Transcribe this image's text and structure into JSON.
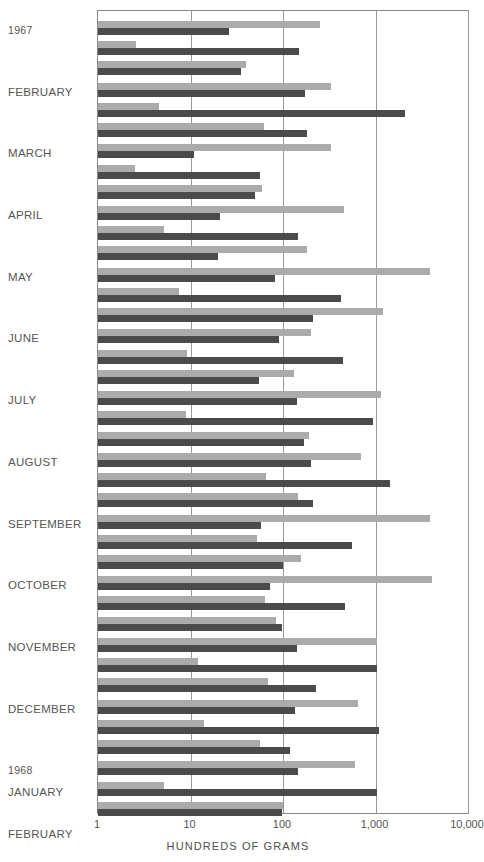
{
  "chart_data": {
    "type": "bar",
    "orientation": "horizontal",
    "title": "",
    "subtitle": "",
    "xlabel": "HUNDREDS OF GRAMS",
    "ylabel": "",
    "xscale": "log",
    "xlim": [
      1,
      10000
    ],
    "xticks": [
      1,
      10,
      100,
      1000,
      10000
    ],
    "xticklabels": [
      "1",
      "10",
      "100",
      "1,000",
      "10,000"
    ],
    "grid": true,
    "legend": "none",
    "colors": {
      "light_series": "#ababab",
      "dark_series": "#4b4b4b",
      "frame": "#8a8a8a",
      "gridline": "#9a9a9a",
      "text": "#565656"
    },
    "series": [
      {
        "name": "light",
        "color": "#ababab"
      },
      {
        "name": "dark",
        "color": "#4b4b4b"
      }
    ],
    "categories": [
      "1967",
      "FEBRUARY",
      "MARCH",
      "APRIL",
      "MAY",
      "JUNE",
      "JULY",
      "AUGUST",
      "SEPTEMBER",
      "OCTOBER",
      "NOVEMBER",
      "DECEMBER",
      "1968",
      "JANUARY",
      "FEBRUARY"
    ],
    "groups": [
      {
        "label": "1967",
        "label_kind": "year",
        "pairs": [
          {
            "light": 250,
            "dark": 26
          },
          {
            "light": 2.6,
            "dark": 150
          },
          {
            "light": 40,
            "dark": 35
          }
        ]
      },
      {
        "label": "FEBRUARY",
        "label_kind": "month",
        "pairs": [
          {
            "light": 330,
            "dark": 175
          },
          {
            "light": 4.6,
            "dark": 2100
          },
          {
            "light": 62,
            "dark": 180
          }
        ]
      },
      {
        "label": "MARCH",
        "label_kind": "month",
        "pairs": [
          {
            "light": 330,
            "dark": 11
          },
          {
            "light": 2.5,
            "dark": 56
          },
          {
            "light": 60,
            "dark": 50
          }
        ]
      },
      {
        "label": "APRIL",
        "label_kind": "month",
        "pairs": [
          {
            "light": 460,
            "dark": 21
          },
          {
            "light": 5.2,
            "dark": 145
          },
          {
            "light": 180,
            "dark": 20
          }
        ]
      },
      {
        "label": "MAY",
        "label_kind": "month",
        "pairs": [
          {
            "light": 3900,
            "dark": 82
          },
          {
            "light": 7.5,
            "dark": 420
          },
          {
            "light": 1200,
            "dark": 210
          }
        ]
      },
      {
        "label": "JUNE",
        "label_kind": "month",
        "pairs": [
          {
            "light": 200,
            "dark": 90
          },
          {
            "light": 9.2,
            "dark": 440
          },
          {
            "light": 130,
            "dark": 55
          }
        ]
      },
      {
        "label": "JULY",
        "label_kind": "month",
        "pairs": [
          {
            "light": 1150,
            "dark": 140
          },
          {
            "light": 9.0,
            "dark": 950
          },
          {
            "light": 190,
            "dark": 170
          }
        ]
      },
      {
        "label": "AUGUST",
        "label_kind": "month",
        "pairs": [
          {
            "light": 700,
            "dark": 200
          },
          {
            "light": 66,
            "dark": 1450
          },
          {
            "light": 145,
            "dark": 210
          }
        ]
      },
      {
        "label": "SEPTEMBER",
        "label_kind": "month",
        "pairs": [
          {
            "light": 3900,
            "dark": 58
          },
          {
            "light": 52,
            "dark": 560
          },
          {
            "light": 155,
            "dark": 100
          }
        ]
      },
      {
        "label": "OCTOBER",
        "label_kind": "month",
        "pairs": [
          {
            "light": 4100,
            "dark": 72
          },
          {
            "light": 64,
            "dark": 470
          },
          {
            "light": 85,
            "dark": 98
          }
        ]
      },
      {
        "label": "NOVEMBER",
        "label_kind": "month",
        "pairs": [
          {
            "light": 1050,
            "dark": 140
          },
          {
            "light": 12,
            "dark": 1050
          },
          {
            "light": 68,
            "dark": 230
          }
        ]
      },
      {
        "label": "DECEMBER",
        "label_kind": "month",
        "pairs": [
          {
            "light": 640,
            "dark": 135
          },
          {
            "light": 14,
            "dark": 1100
          },
          {
            "light": 56,
            "dark": 120
          }
        ]
      },
      {
        "label": "1968",
        "label_kind": "year",
        "pairs": [
          {
            "light": 600,
            "dark": 145
          },
          {
            "light": 5.2,
            "dark": 1050
          },
          {
            "light": 100,
            "dark": 98
          }
        ]
      }
    ]
  },
  "axis": {
    "x_title": "HUNDREDS OF GRAMS",
    "ticks": [
      "1",
      "10",
      "100",
      "1,000",
      "10,000"
    ]
  }
}
